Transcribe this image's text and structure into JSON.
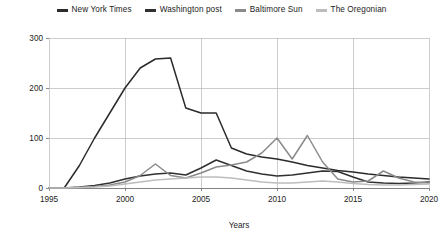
{
  "chart_data": {
    "type": "line",
    "title": "",
    "xlabel": "Years",
    "ylabel": "",
    "xlim": [
      1995,
      2020
    ],
    "ylim": [
      0,
      300
    ],
    "xticks": [
      1995,
      2000,
      2005,
      2010,
      2015,
      2020
    ],
    "xtick_labels": [
      "1995",
      "2000",
      "2005",
      "2010",
      "2015",
      "2020"
    ],
    "yticks": [
      0,
      100,
      200,
      300
    ],
    "ytick_labels": [
      "0",
      "100",
      "200",
      "300"
    ],
    "grid": true,
    "grid_axis": "both",
    "legend_position": "top-center",
    "x": [
      1995,
      1996,
      1997,
      1998,
      1999,
      2000,
      2001,
      2002,
      2003,
      2004,
      2005,
      2006,
      2007,
      2008,
      2009,
      2010,
      2011,
      2012,
      2013,
      2014,
      2015,
      2016,
      2017,
      2018,
      2019,
      2020
    ],
    "series": [
      {
        "name": "New York Times",
        "color": "#2b2b2b",
        "values": [
          0,
          0,
          45,
          100,
          150,
          200,
          240,
          258,
          260,
          160,
          150,
          150,
          80,
          68,
          62,
          58,
          52,
          45,
          40,
          35,
          32,
          28,
          25,
          22,
          20,
          18
        ]
      },
      {
        "name": "Washington post",
        "color": "#303030",
        "values": [
          0,
          0,
          2,
          5,
          10,
          18,
          24,
          28,
          30,
          26,
          40,
          56,
          45,
          34,
          28,
          24,
          26,
          30,
          34,
          33,
          22,
          12,
          10,
          9,
          10,
          12
        ]
      },
      {
        "name": "Baltimore Sun",
        "color": "#8a8a8a",
        "values": [
          0,
          0,
          1,
          3,
          6,
          12,
          25,
          48,
          25,
          20,
          30,
          42,
          46,
          52,
          70,
          100,
          58,
          105,
          52,
          18,
          12,
          14,
          34,
          20,
          12,
          10
        ]
      },
      {
        "name": "The Oregonian",
        "color": "#bdbdbd",
        "values": [
          0,
          0,
          1,
          2,
          4,
          8,
          12,
          16,
          18,
          20,
          22,
          22,
          20,
          16,
          12,
          10,
          10,
          12,
          14,
          12,
          9,
          7,
          6,
          6,
          7,
          8
        ]
      }
    ]
  }
}
